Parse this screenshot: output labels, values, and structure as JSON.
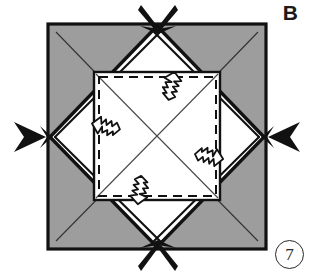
{
  "figure": {
    "label": "B",
    "step_number": "7",
    "caption_badge_shape": "circle",
    "colors": {
      "paper_front": "#ffffff",
      "paper_back_shaded": "#9d9d9d",
      "ink": "#111111",
      "thin_crease": "#4a4a4a",
      "background": "#ffffff"
    },
    "geometry": {
      "outer_square": {
        "x": 48,
        "y": 24,
        "width": 218,
        "height": 225
      },
      "inner_square": {
        "x": 94,
        "y": 72,
        "width": 126,
        "height": 128
      },
      "diamond_vertices_label": "midpoints of outer square edges"
    },
    "shaded_corner_triangles": [
      {
        "name": "top-left",
        "note": "gray back-of-paper triangle with thin crease diagonal"
      },
      {
        "name": "top-right",
        "note": "gray back-of-paper triangle with thin crease diagonal"
      },
      {
        "name": "bottom-left",
        "note": "gray back-of-paper triangle with thin crease diagonal"
      },
      {
        "name": "bottom-right",
        "note": "gray back-of-paper triangle with thin crease diagonal"
      }
    ],
    "edge_markers": [
      {
        "name": "top-pinch-marker",
        "direction": "down",
        "position": "top-center"
      },
      {
        "name": "right-pinch-marker",
        "direction": "left",
        "position": "right-center"
      },
      {
        "name": "bottom-pinch-marker",
        "direction": "up",
        "position": "bottom-center"
      },
      {
        "name": "left-pinch-marker",
        "direction": "right",
        "position": "left-center"
      }
    ],
    "fold_arrows": [
      {
        "name": "fold-arrow-up",
        "direction": "up",
        "x": 172,
        "y": 86
      },
      {
        "name": "fold-arrow-left",
        "direction": "left",
        "x": 106,
        "y": 126
      },
      {
        "name": "fold-arrow-right",
        "direction": "right",
        "x": 208,
        "y": 156
      },
      {
        "name": "fold-arrow-down",
        "direction": "down",
        "x": 139,
        "y": 190
      }
    ],
    "crease_lines": {
      "inner_dashed_square": true,
      "inner_diagonals": 2,
      "corner_diagonals": 4
    }
  }
}
